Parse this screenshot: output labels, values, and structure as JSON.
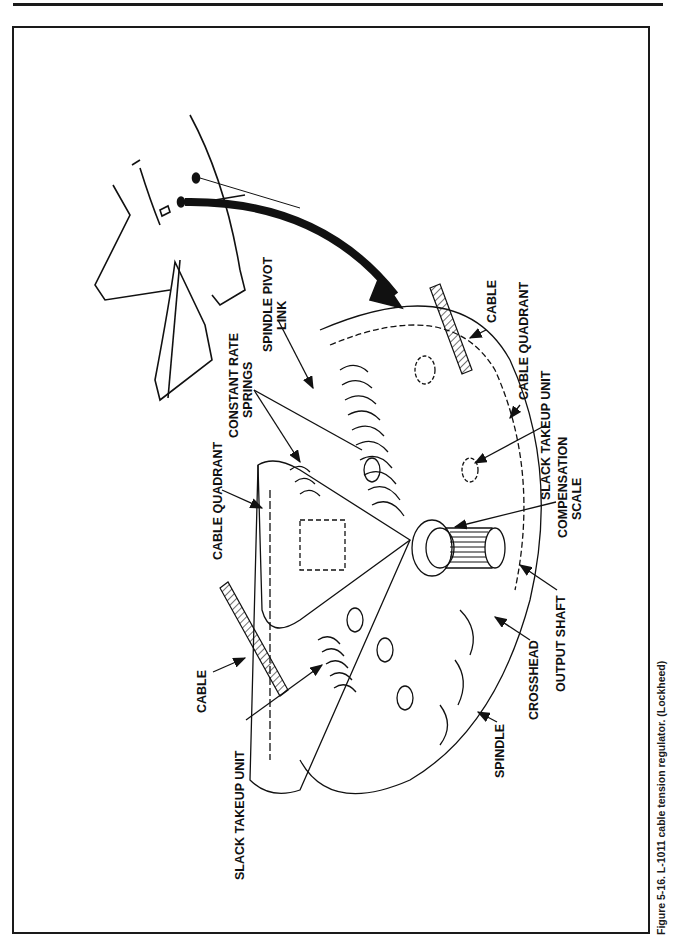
{
  "figure": {
    "caption": "Figure 5-16. L-1011 cable tension regulator. (Lockheed)",
    "labels": {
      "slack_takeup_unit_left": "SLACK TAKEUP UNIT",
      "cable_left": "CABLE",
      "cable_quadrant_left": "CABLE QUADRANT",
      "constant_rate_springs_1": "CONSTANT RATE",
      "constant_rate_springs_2": "SPRINGS",
      "spindle_pivot_link_1": "SPINDLE PIVOT",
      "spindle_pivot_link_2": "LINK",
      "cable_right": "CABLE",
      "cable_quadrant_right": "CABLE QUADRANT",
      "slack_takeup_unit_right": "SLACK TAKEUP UNIT",
      "compensation_scale_1": "COMPENSATION",
      "compensation_scale_2": "SCALE",
      "output_shaft": "OUTPUT SHAFT",
      "crosshead": "CROSSHEAD",
      "spindle": "SPINDLE"
    }
  },
  "colors": {
    "ink": "#111111",
    "paper": "#ffffff"
  }
}
